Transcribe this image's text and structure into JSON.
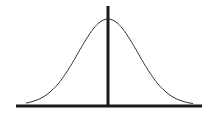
{
  "diagram": {
    "type": "normal-distribution",
    "colors": {
      "background": "#ffffff",
      "curve": "#333333",
      "axis": "#1a1a1a"
    },
    "baseline": {
      "x1": 16,
      "x2": 202,
      "y": 106
    },
    "center_line": {
      "x": 108,
      "y1": 6,
      "y2": 107
    },
    "curve": {
      "left_x": 26,
      "right_x": 193,
      "peak_x": 108,
      "peak_y": 19,
      "base_y": 105
    }
  }
}
